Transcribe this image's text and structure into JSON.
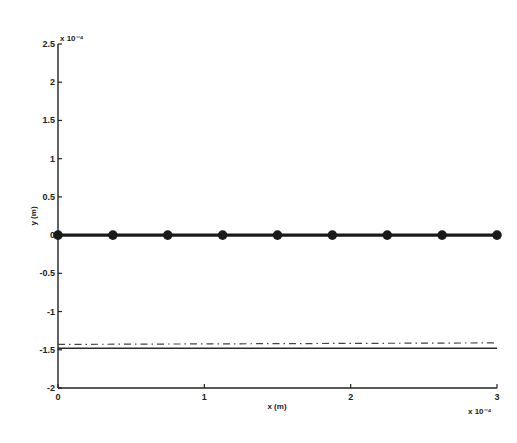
{
  "chart_data": {
    "type": "line",
    "title": "",
    "xlabel": "x (m)",
    "ylabel": "y (m)",
    "x_scale_label": "x 10⁻⁴",
    "y_scale_label": "x 10⁻⁴",
    "xlim": [
      0,
      3
    ],
    "ylim": [
      -2,
      2.5
    ],
    "x_multiplier": 0.0001,
    "y_multiplier": 0.0001,
    "xticks": [
      "0",
      "1",
      "2",
      "3"
    ],
    "yticks": [
      "2.5",
      "2",
      "1.5",
      "1",
      "0.5",
      "0",
      "-0.5",
      "-1",
      "-1.5",
      "-2"
    ],
    "grid": false,
    "legend": null,
    "series": [
      {
        "name": "beam (markers)",
        "style": "thick solid with filled circle markers",
        "x": [
          0,
          0.375,
          0.75,
          1.125,
          1.5,
          1.875,
          2.25,
          2.625,
          3.0
        ],
        "y": [
          0,
          0,
          0,
          0,
          0,
          0,
          0,
          0,
          0
        ]
      },
      {
        "name": "dash-dot line",
        "style": "dash-dot",
        "x": [
          0,
          3
        ],
        "y": [
          -1.43,
          -1.41
        ]
      },
      {
        "name": "solid line",
        "style": "solid thin",
        "x": [
          0,
          3
        ],
        "y": [
          -1.48,
          -1.48
        ]
      }
    ]
  }
}
